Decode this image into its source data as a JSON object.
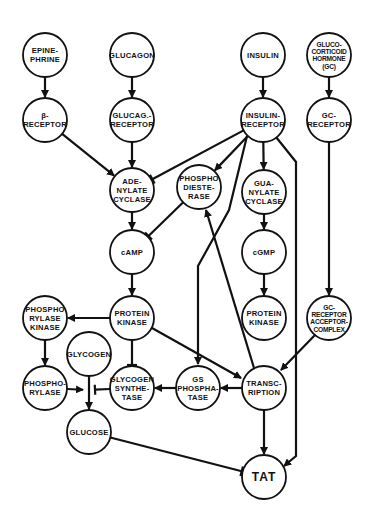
{
  "diagram": {
    "title": "",
    "colors": {
      "stroke": "#111111",
      "background": "#ffffff"
    },
    "nodes": [
      {
        "id": "epinephrine",
        "lines": [
          "EPINE-",
          "PHRINE"
        ],
        "x": 45,
        "y": 55
      },
      {
        "id": "glucagon",
        "lines": [
          "GLUCAGON"
        ],
        "x": 132,
        "y": 55
      },
      {
        "id": "insulin",
        "lines": [
          "INSULIN"
        ],
        "x": 263,
        "y": 55
      },
      {
        "id": "glucocorticoid-hormone",
        "lines": [
          "GLUCO-",
          "CORTICOID",
          "HORMONE",
          "(GC)"
        ],
        "x": 329,
        "y": 55
      },
      {
        "id": "beta-receptor",
        "lines": [
          "β-",
          "RECEPTOR"
        ],
        "x": 45,
        "y": 120
      },
      {
        "id": "glucagon-receptor",
        "lines": [
          "GLUCAG.-",
          "RECEPTOR"
        ],
        "x": 132,
        "y": 120
      },
      {
        "id": "insulin-receptor",
        "lines": [
          "INSULIN-",
          "RECEPTOR"
        ],
        "x": 263,
        "y": 120
      },
      {
        "id": "gc-receptor",
        "lines": [
          "GC-",
          "RECEPTOR"
        ],
        "x": 329,
        "y": 120
      },
      {
        "id": "adenylate-cyclase",
        "lines": [
          "ADE-",
          "NYLATE",
          "CYCLASE"
        ],
        "x": 132,
        "y": 190
      },
      {
        "id": "phosphodiesterase",
        "lines": [
          "PHOSPHO",
          "DIESTE-",
          "RASE"
        ],
        "x": 199,
        "y": 187
      },
      {
        "id": "guanylate-cyclase",
        "lines": [
          "GUA-",
          "NYLATE",
          "CYCLASE"
        ],
        "x": 264,
        "y": 192
      },
      {
        "id": "camp",
        "lines": [
          "cAMP"
        ],
        "x": 132,
        "y": 252
      },
      {
        "id": "cgmp",
        "lines": [
          "cGMP"
        ],
        "x": 264,
        "y": 252
      },
      {
        "id": "protein-kinase-a",
        "lines": [
          "PROTEIN",
          "KINASE"
        ],
        "x": 132,
        "y": 318
      },
      {
        "id": "protein-kinase-g",
        "lines": [
          "PROTEIN",
          "KINASE"
        ],
        "x": 264,
        "y": 318
      },
      {
        "id": "gc-receptor-acceptor-complex",
        "lines": [
          "GC-",
          "RECEPTOR",
          "ACCEPTOR-",
          "COMPLEX"
        ],
        "x": 329,
        "y": 318
      },
      {
        "id": "phosphorylase-kinase",
        "lines": [
          "PHOSPHO",
          "RYLASE",
          "KINASE"
        ],
        "x": 45,
        "y": 318
      },
      {
        "id": "glycogen",
        "lines": [
          "GLYCOGEN"
        ],
        "x": 89,
        "y": 354
      },
      {
        "id": "phosphorylase",
        "lines": [
          "PHOSPHO-",
          "RYLASE"
        ],
        "x": 45,
        "y": 388
      },
      {
        "id": "glycogen-synthetase",
        "lines": [
          "GLYCOGEN",
          "SYNTHE-",
          "TASE"
        ],
        "x": 132,
        "y": 388
      },
      {
        "id": "gs-phosphatase",
        "lines": [
          "GS",
          "PHOSPHA-",
          "TASE"
        ],
        "x": 198,
        "y": 388
      },
      {
        "id": "transcription",
        "lines": [
          "TRANSC-",
          "RIPTION"
        ],
        "x": 264,
        "y": 388
      },
      {
        "id": "glucose",
        "lines": [
          "GLUCOSE"
        ],
        "x": 89,
        "y": 432
      },
      {
        "id": "tat",
        "lines": [
          "TAT"
        ],
        "x": 264,
        "y": 477
      }
    ],
    "edges": [
      {
        "from": "epinephrine",
        "to": "beta-receptor",
        "type": "activate"
      },
      {
        "from": "glucagon",
        "to": "glucagon-receptor",
        "type": "activate"
      },
      {
        "from": "insulin",
        "to": "insulin-receptor",
        "type": "activate"
      },
      {
        "from": "glucocorticoid-hormone",
        "to": "gc-receptor",
        "type": "activate"
      },
      {
        "from": "beta-receptor",
        "to": "adenylate-cyclase",
        "type": "activate"
      },
      {
        "from": "glucagon-receptor",
        "to": "adenylate-cyclase",
        "type": "activate"
      },
      {
        "from": "insulin-receptor",
        "to": "adenylate-cyclase",
        "type": "inhibit"
      },
      {
        "from": "insulin-receptor",
        "to": "phosphodiesterase",
        "type": "activate"
      },
      {
        "from": "insulin-receptor",
        "to": "guanylate-cyclase",
        "type": "activate"
      },
      {
        "from": "insulin-receptor",
        "to": "gs-phosphatase",
        "type": "activate"
      },
      {
        "from": "insulin-receptor",
        "to": "tat",
        "type": "activate"
      },
      {
        "from": "gc-receptor",
        "to": "gc-receptor-acceptor-complex",
        "type": "activate"
      },
      {
        "from": "adenylate-cyclase",
        "to": "camp",
        "type": "activate"
      },
      {
        "from": "phosphodiesterase",
        "to": "camp",
        "type": "inhibit"
      },
      {
        "from": "guanylate-cyclase",
        "to": "cgmp",
        "type": "activate"
      },
      {
        "from": "camp",
        "to": "protein-kinase-a",
        "type": "activate"
      },
      {
        "from": "cgmp",
        "to": "protein-kinase-g",
        "type": "activate"
      },
      {
        "from": "protein-kinase-a",
        "to": "phosphorylase-kinase",
        "type": "activate"
      },
      {
        "from": "protein-kinase-a",
        "to": "glycogen-synthetase",
        "type": "inhibit"
      },
      {
        "from": "protein-kinase-a",
        "to": "transcription",
        "type": "activate"
      },
      {
        "from": "phosphorylase-kinase",
        "to": "phosphorylase",
        "type": "activate"
      },
      {
        "from": "phosphorylase",
        "to": "glycogen-to-glucose",
        "type": "activate"
      },
      {
        "from": "glycogen-synthetase",
        "to": "glycogen-to-glucose",
        "type": "inhibit"
      },
      {
        "from": "glycogen",
        "to": "glucose",
        "type": "activate"
      },
      {
        "from": "gs-phosphatase",
        "to": "glycogen-synthetase",
        "type": "activate"
      },
      {
        "from": "transcription",
        "to": "gs-phosphatase",
        "type": "activate"
      },
      {
        "from": "transcription",
        "to": "phosphodiesterase",
        "type": "activate"
      },
      {
        "from": "gc-receptor-acceptor-complex",
        "to": "transcription",
        "type": "activate"
      },
      {
        "from": "transcription",
        "to": "tat",
        "type": "activate"
      },
      {
        "from": "glucose",
        "to": "tat",
        "type": "inhibit"
      }
    ]
  }
}
